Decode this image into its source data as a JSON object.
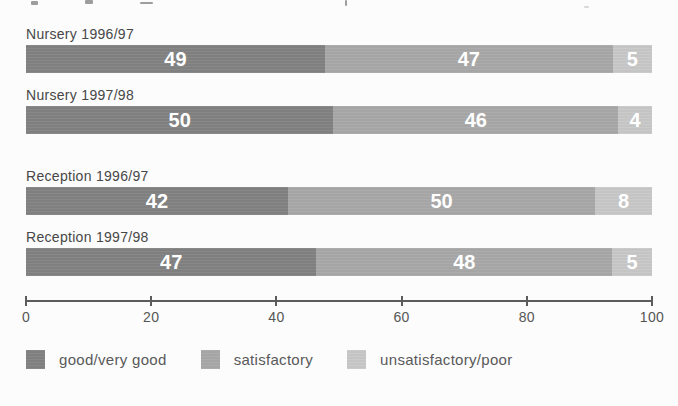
{
  "chart_data": {
    "type": "bar",
    "orientation": "horizontal-stacked",
    "categories": [
      "Nursery 1996/97",
      "Nursery 1997/98",
      "Reception 1996/97",
      "Reception 1997/98"
    ],
    "series": [
      {
        "name": "good/very good",
        "color": "#828282",
        "values": [
          49,
          50,
          42,
          47
        ]
      },
      {
        "name": "satisfactory",
        "color": "#a8a8a8",
        "values": [
          47,
          46,
          50,
          48
        ]
      },
      {
        "name": "unsatisfactory/poor",
        "color": "#c8c8c8",
        "values": [
          5,
          4,
          8,
          5
        ]
      }
    ],
    "xlim": [
      0,
      100
    ],
    "xticks": [
      "0",
      "20",
      "40",
      "60",
      "80",
      "100"
    ],
    "grid": false,
    "legend_position": "bottom",
    "value_labels": "inside, white bold",
    "title": "",
    "xlabel": "",
    "ylabel": ""
  }
}
